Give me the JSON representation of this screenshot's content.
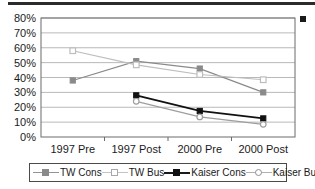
{
  "chart_data": {
    "type": "line",
    "title": "",
    "xlabel": "",
    "ylabel": "",
    "categories": [
      "1997 Pre",
      "1997 Post",
      "2000 Pre",
      "2000 Post"
    ],
    "ylim": [
      0,
      80
    ],
    "ytick_labels": [
      "0%",
      "10%",
      "20%",
      "30%",
      "40%",
      "50%",
      "60%",
      "70%",
      "80%"
    ],
    "ytick_values": [
      0,
      10,
      20,
      30,
      40,
      50,
      60,
      70,
      80
    ],
    "grid": true,
    "legend_position": "bottom",
    "series": [
      {
        "name": "TW Cons",
        "marker": "filled-square",
        "color": "#8a8a8a",
        "values": [
          38,
          51,
          46,
          30
        ]
      },
      {
        "name": "TW Bus",
        "marker": "open-square",
        "color": "#bdbdbd",
        "values": [
          58,
          48.5,
          42,
          38.5
        ]
      },
      {
        "name": "Kaiser Cons",
        "marker": "filled-square",
        "color": "#111111",
        "values": [
          null,
          28,
          17.5,
          12.5
        ]
      },
      {
        "name": "Kaiser Bus",
        "marker": "open-circle",
        "color": "#9e9e9e",
        "values": [
          null,
          24,
          13.5,
          8.5
        ]
      }
    ]
  },
  "legend": {
    "items": [
      {
        "label": "TW Cons",
        "icon": "filled-square-marker-icon"
      },
      {
        "label": "TW Bus",
        "icon": "open-square-marker-icon"
      },
      {
        "label": "Kaiser Cons",
        "icon": "filled-square-marker-icon"
      },
      {
        "label": "Kaiser Bus",
        "icon": "open-circle-marker-icon"
      }
    ]
  },
  "decor": {
    "top_rule": "horizontal-rule",
    "corner_marker": "black-square-marker"
  }
}
